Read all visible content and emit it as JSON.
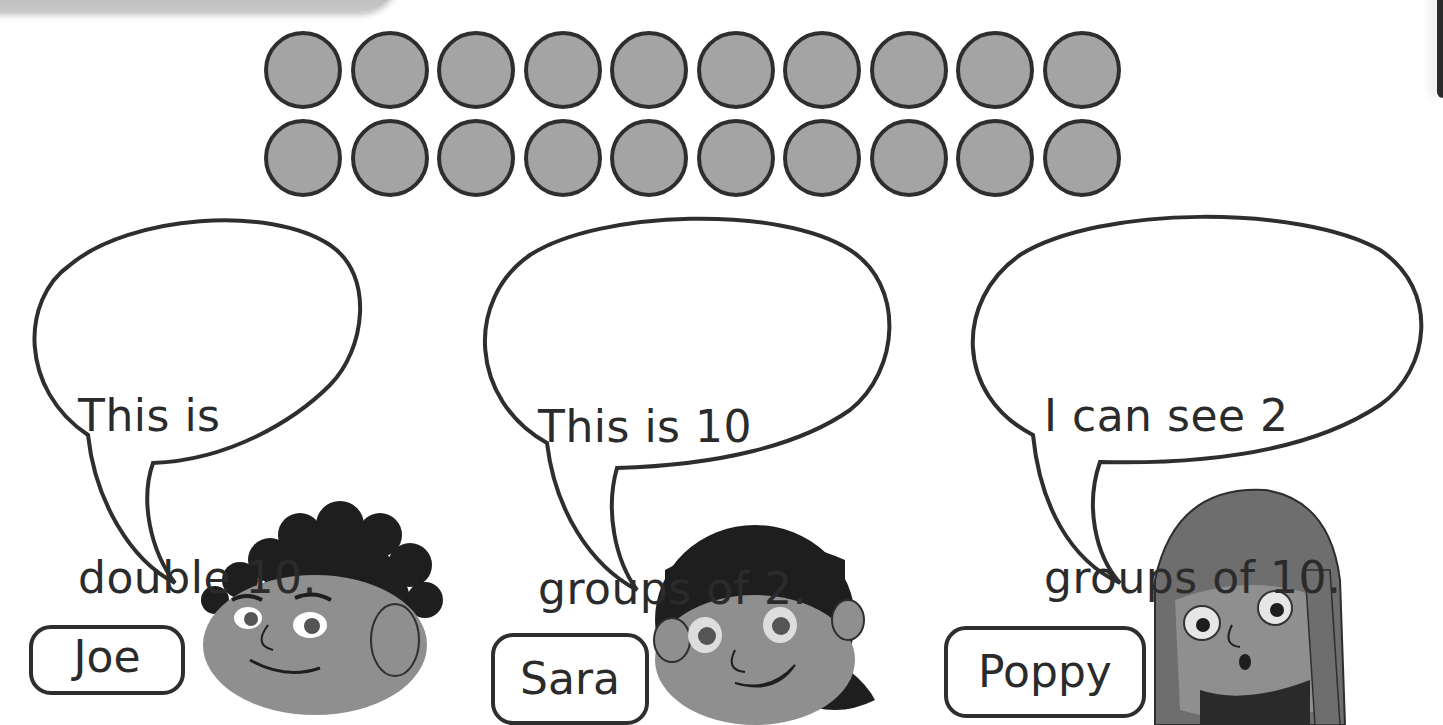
{
  "counters": {
    "rows": 2,
    "per_row": 10,
    "total": 20,
    "fill_color": "#a4a4a4",
    "stroke_color": "#2e2e2e"
  },
  "characters": [
    {
      "name": "Joe",
      "speech_line1": "This is",
      "speech_line2": "double 10."
    },
    {
      "name": "Sara",
      "speech_line1": "This is 10",
      "speech_line2": "groups of 2."
    },
    {
      "name": "Poppy",
      "speech_line1": "I can see 2",
      "speech_line2": "groups of 10."
    }
  ]
}
